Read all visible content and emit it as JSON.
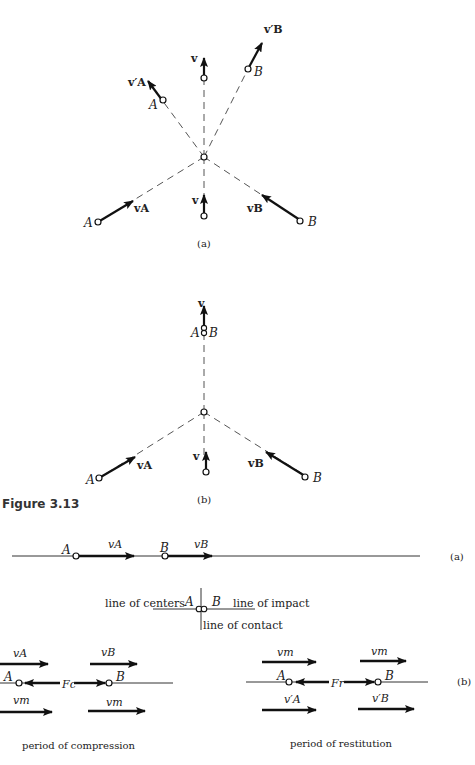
{
  "figure": {
    "caption": "Figure 3.13",
    "part_a_label": "(a)",
    "part_b_label": "(b)"
  },
  "top_a": {
    "v_label": "v",
    "vA_prime_label": "v′A",
    "vB_prime_label": "v′B",
    "A_label": "A",
    "B_label": "B",
    "vA_label": "vA",
    "vB_label": "vB",
    "v_bottom_label": "v",
    "A_bottom_label": "A",
    "B_bottom_label": "B",
    "sublabel": "(a)"
  },
  "top_b": {
    "v_label": "v",
    "AB_label_A": "A",
    "AB_label_B": "B",
    "vA_label": "vA",
    "vB_label": "vB",
    "v_bottom_label": "v",
    "A_label": "A",
    "B_label": "B",
    "sublabel": "(b)"
  },
  "bottom_a": {
    "A_label": "A",
    "B_label": "B",
    "vA_label": "vA",
    "vB_label": "vB",
    "sublabel": "(a)"
  },
  "contact": {
    "line_of_centers": "line of centers",
    "line_of_impact": "line of impact",
    "line_of_contact": "line of contact",
    "A_label": "A",
    "B_label": "B"
  },
  "compression": {
    "vA_label": "vA",
    "vB_label": "vB",
    "A_label": "A",
    "B_label": "B",
    "force_label": "Fc",
    "vm_left": "vm",
    "vm_right": "vm",
    "title": "period of compression"
  },
  "restitution": {
    "vm_left": "vm",
    "vm_right": "vm",
    "A_label": "A",
    "B_label": "B",
    "force_label": "Fr",
    "vA_prime": "v′A",
    "vB_prime": "v′B",
    "title": "period of restitution",
    "sublabel": "(b)"
  }
}
